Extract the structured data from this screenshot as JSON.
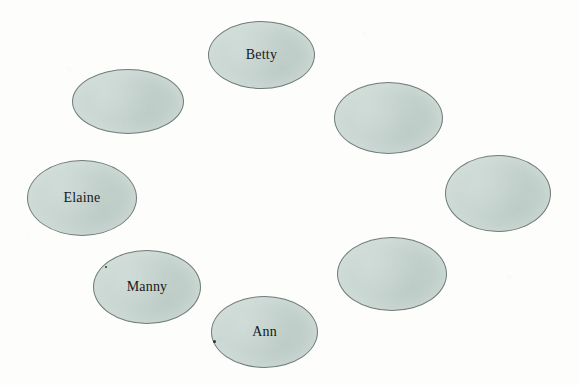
{
  "diagram": {
    "type": "node-ring",
    "background_color": "#fdfdfc",
    "node_fill_color": "#c4d3ce",
    "node_border_color": "#6f7d79",
    "label_color": "#16181a",
    "node_count": 8,
    "labeled_count": 4,
    "nodes": [
      {
        "id": "node-top",
        "label": "Betty",
        "x": 208,
        "y": 21,
        "width": 107,
        "height": 68,
        "has_label": true
      },
      {
        "id": "node-top-left",
        "label": "",
        "x": 72,
        "y": 69,
        "width": 112,
        "height": 65,
        "has_label": false
      },
      {
        "id": "node-top-right",
        "label": "",
        "x": 334,
        "y": 82,
        "width": 109,
        "height": 72,
        "has_label": false
      },
      {
        "id": "node-left",
        "label": "Elaine",
        "x": 27,
        "y": 160,
        "width": 110,
        "height": 76,
        "has_label": true
      },
      {
        "id": "node-right",
        "label": "",
        "x": 445,
        "y": 155,
        "width": 106,
        "height": 77,
        "has_label": false
      },
      {
        "id": "node-bottom-left",
        "label": "Manny",
        "x": 93,
        "y": 250,
        "width": 108,
        "height": 74,
        "has_label": true
      },
      {
        "id": "node-bottom-right",
        "label": "",
        "x": 337,
        "y": 237,
        "width": 110,
        "height": 74,
        "has_label": false
      },
      {
        "id": "node-bottom",
        "label": "Ann",
        "x": 211,
        "y": 296,
        "width": 107,
        "height": 72,
        "has_label": true
      }
    ],
    "specks": [
      {
        "id": "speck-manny",
        "x": 105,
        "y": 266,
        "size": 2
      },
      {
        "id": "speck-ann",
        "x": 213,
        "y": 340,
        "size": 3
      }
    ]
  }
}
